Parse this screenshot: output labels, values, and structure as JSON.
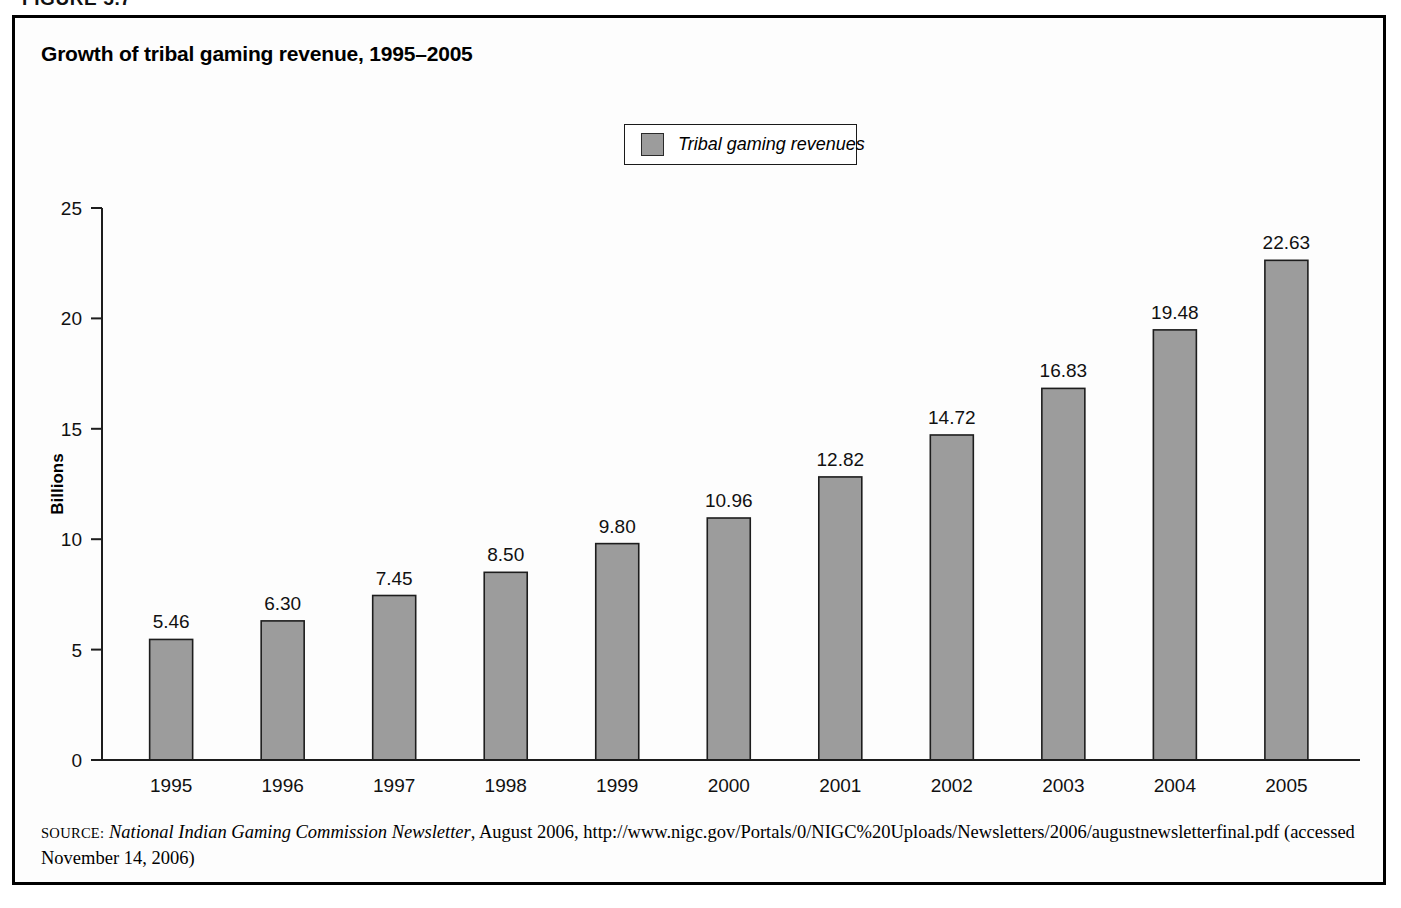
{
  "figure": {
    "number_label": "FIGURE 5.7"
  },
  "chart_title": "Growth of tribal gaming revenue, 1995–2005",
  "legend": {
    "swatch_color": "#9c9c9c",
    "entries": [
      {
        "label": "Tribal gaming revenues"
      }
    ]
  },
  "axis": {
    "y_title": "Billions",
    "y_ticks": [
      "0",
      "5",
      "10",
      "15",
      "20",
      "25"
    ],
    "x_ticks": [
      "1995",
      "1996",
      "1997",
      "1998",
      "1999",
      "2000",
      "2001",
      "2002",
      "2003",
      "2004",
      "2005"
    ]
  },
  "source": {
    "label": "SOURCE:",
    "publication": "National Indian Gaming Commission Newsletter",
    "rest": ", August 2006, http://www.nigc.gov/Portals/0/NIGC%20Uploads/Newsletters/2006/augustnewsletterfinal.pdf (accessed November 14, 2006)"
  },
  "chart_data": {
    "type": "bar",
    "title": "Growth of tribal gaming revenue, 1995–2005",
    "xlabel": "",
    "ylabel": "Billions",
    "ylim": [
      0,
      25
    ],
    "ytick_step": 5,
    "grid": false,
    "legend_position": "top-center",
    "bar_color": "#9c9c9c",
    "bar_edge_color": "#1d1d1d",
    "categories": [
      "1995",
      "1996",
      "1997",
      "1998",
      "1999",
      "2000",
      "2001",
      "2002",
      "2003",
      "2004",
      "2005"
    ],
    "series": [
      {
        "name": "Tribal gaming revenues",
        "values": [
          5.46,
          6.3,
          7.45,
          8.5,
          9.8,
          10.96,
          12.82,
          14.72,
          16.83,
          19.48,
          22.63
        ],
        "value_labels": [
          "5.46",
          "6.30",
          "7.45",
          "8.50",
          "9.80",
          "10.96",
          "12.82",
          "14.72",
          "16.83",
          "19.48",
          "22.63"
        ]
      }
    ]
  }
}
